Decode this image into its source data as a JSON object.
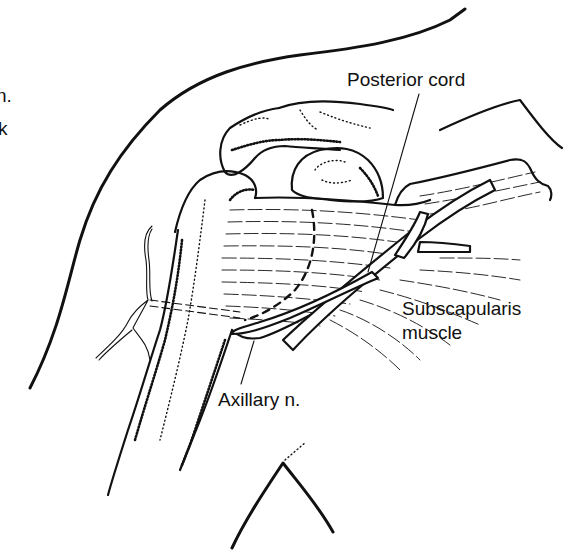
{
  "figure": {
    "type": "anatomical line drawing",
    "colors": {
      "ink": "#111111",
      "background": "#ffffff"
    }
  },
  "labels": {
    "posterior_cord": "Posterior cord",
    "subscapularis_line1": "Subscapularis",
    "subscapularis_line2": "muscle",
    "axillary_nerve": "Axillary n."
  },
  "cropped_fragments": {
    "top_left_1": "n.",
    "top_left_2": "k"
  }
}
